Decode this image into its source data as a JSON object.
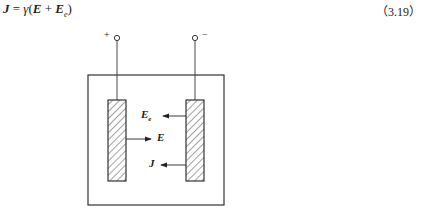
{
  "equation": {
    "lhs": "J",
    "equals": " = ",
    "gamma": "γ",
    "open": "(",
    "e": "E",
    "plus": " + ",
    "ee": "E",
    "ee_sub": "e",
    "close": ")",
    "number": "（3.19）"
  },
  "figure": {
    "terminal_plus": "+",
    "terminal_minus": "−",
    "label_ee": "E",
    "label_ee_sub": "e",
    "label_e": "E",
    "label_j": "J"
  }
}
